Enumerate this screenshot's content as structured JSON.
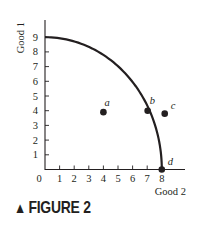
{
  "figure": {
    "caption_marker": "▲",
    "caption": "FIGURE 2"
  },
  "chart_data": {
    "type": "line",
    "title": "",
    "xlabel": "Good 2",
    "ylabel": "Good 1",
    "xlim": [
      0,
      8.8
    ],
    "ylim": [
      0,
      9.8
    ],
    "x_ticks": [
      0,
      1,
      2,
      3,
      4,
      5,
      6,
      7,
      8
    ],
    "y_ticks": [
      1,
      2,
      3,
      4,
      5,
      6,
      7,
      8,
      9
    ],
    "grid": false,
    "series": [
      {
        "name": "Production possibilities frontier",
        "description": "Concave curve from (0, 9) to (8, 0)",
        "x": [
          0,
          1,
          2,
          3,
          4,
          5,
          6,
          7,
          7.5,
          8
        ],
        "y": [
          9,
          8.93,
          8.72,
          8.37,
          7.87,
          7.2,
          6.32,
          4.0,
          2.9,
          0
        ]
      }
    ],
    "points": [
      {
        "label": "a",
        "x": 4,
        "y": 3.9
      },
      {
        "label": "b",
        "x": 7,
        "y": 4.0
      },
      {
        "label": "c",
        "x": 8.2,
        "y": 3.8
      },
      {
        "label": "d",
        "x": 8,
        "y": 0
      }
    ]
  }
}
